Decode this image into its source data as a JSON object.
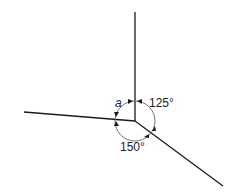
{
  "diagram": {
    "labels": {
      "angle_a": "a",
      "angle_125": "125°",
      "angle_150": "150°"
    },
    "colors": {
      "line": "#1a1a1a",
      "arc": "#555555",
      "background": "#ffffff"
    }
  }
}
